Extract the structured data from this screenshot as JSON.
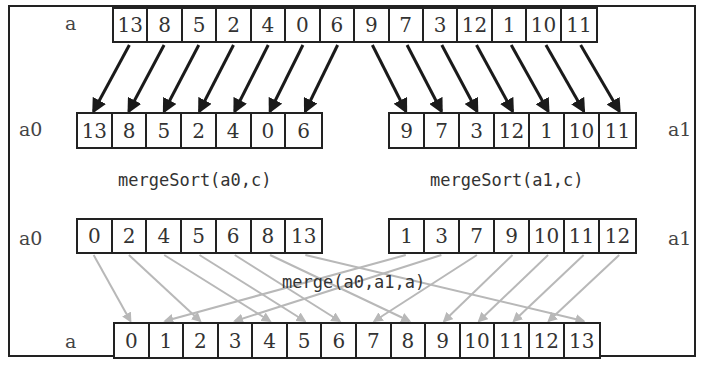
{
  "diagram": {
    "title": "",
    "rows": {
      "input": {
        "label": "a",
        "values": [
          "13",
          "8",
          "5",
          "2",
          "4",
          "0",
          "6",
          "9",
          "7",
          "3",
          "12",
          "1",
          "10",
          "11"
        ]
      },
      "split_left": {
        "label": "a0",
        "values": [
          "13",
          "8",
          "5",
          "2",
          "4",
          "0",
          "6"
        ]
      },
      "split_right": {
        "label": "a1",
        "values": [
          "9",
          "7",
          "3",
          "12",
          "1",
          "10",
          "11"
        ]
      },
      "sorted_left": {
        "label": "a0",
        "values": [
          "0",
          "2",
          "4",
          "5",
          "6",
          "8",
          "13"
        ]
      },
      "sorted_right": {
        "label": "a1",
        "values": [
          "1",
          "3",
          "7",
          "9",
          "10",
          "11",
          "12"
        ]
      },
      "output": {
        "label": "a",
        "values": [
          "0",
          "1",
          "2",
          "3",
          "4",
          "5",
          "6",
          "7",
          "8",
          "9",
          "10",
          "11",
          "12",
          "13"
        ]
      }
    },
    "captions": {
      "sort_left": "mergeSort(a0,c)",
      "sort_right": "mergeSort(a1,c)",
      "merge": "merge(a0,a1,a)"
    },
    "colors": {
      "split_arrow": "#1a1a1a",
      "merge_arrow": "#b8b8b8",
      "border": "#222222"
    }
  }
}
